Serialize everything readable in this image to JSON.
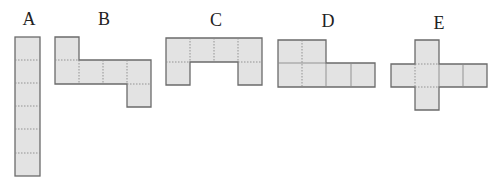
{
  "figure": {
    "cell_fill": "#e3e3e3",
    "outline_color": "#6b6b6b",
    "labels": [
      {
        "id": "A",
        "text": "A",
        "x": 29,
        "y": 10
      },
      {
        "id": "B",
        "text": "B",
        "x": 104,
        "y": 10
      },
      {
        "id": "C",
        "text": "C",
        "x": 216,
        "y": 11
      },
      {
        "id": "D",
        "text": "D",
        "x": 328,
        "y": 12
      },
      {
        "id": "E",
        "text": "E",
        "x": 439,
        "y": 14
      }
    ],
    "nets": [
      {
        "id": "A",
        "shape": "6 squares in a vertical column"
      },
      {
        "id": "B",
        "shape": "1 square on top-left, row of 4, 1 square below right end"
      },
      {
        "id": "C",
        "shape": "row of 4 with squares below both ends"
      },
      {
        "id": "D",
        "shape": "2 squares on top, row of 4 below aligned left"
      },
      {
        "id": "E",
        "shape": "cross: row of 4 with squares above and below second square"
      }
    ]
  }
}
